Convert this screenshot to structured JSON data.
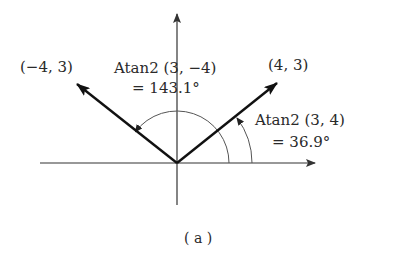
{
  "figure": {
    "caption": "( a )",
    "axes": {
      "x_axis": "horizontal",
      "y_axis": "vertical"
    },
    "vectors": [
      {
        "name": "vector-4-3",
        "label": "(4, 3)",
        "x": 4,
        "y": 3
      },
      {
        "name": "vector-neg4-3",
        "label": "(−4, 3)",
        "x": -4,
        "y": 3
      }
    ],
    "angles": [
      {
        "name": "angle-36-9",
        "line1": "Atan2 (3, 4)",
        "line2": "= 36.9°",
        "degrees": 36.9
      },
      {
        "name": "angle-143-1",
        "line1": "Atan2 (3, −4)",
        "line2": "= 143.1°",
        "degrees": 143.1
      }
    ],
    "colors": {
      "vector": "#111111",
      "axis": "#333333",
      "arc": "#555555"
    }
  }
}
